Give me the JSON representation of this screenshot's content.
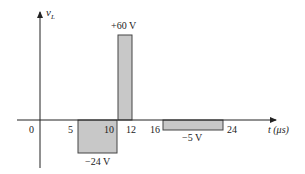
{
  "diagram": {
    "y_axis_label_main": "v",
    "y_axis_label_sub": "L",
    "x_axis_label": "t (μs)",
    "tick_labels": [
      "0",
      "5",
      "10",
      "12",
      "16",
      "24"
    ],
    "pulses": [
      {
        "label": "−24 V",
        "start": 5,
        "end": 10,
        "value": -24
      },
      {
        "label": "+60 V",
        "start": 10,
        "end": 12,
        "value": 60
      },
      {
        "label": "−5 V",
        "start": 16,
        "end": 24,
        "value": -5
      }
    ],
    "colors": {
      "fill": "#c8c8c8",
      "stroke": "#333333"
    }
  }
}
